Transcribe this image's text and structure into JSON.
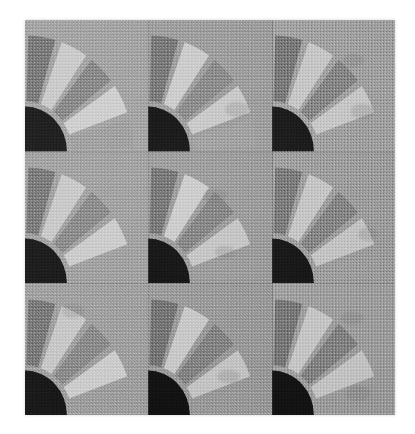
{
  "image": {
    "subject": "quilt-fan-blocks",
    "description": "Grayscale photograph of a patchwork quilt made of nine fan blocks arranged in a three by three grid",
    "page_background": "#ffffff",
    "frame": {
      "left": 25,
      "top": 20,
      "width": 370,
      "height": 395
    }
  },
  "palette": {
    "page": "#ffffff",
    "block_background_light": "#a3a3a3",
    "block_background_mid": "#979797",
    "block_background_dark": "#8d8d8d",
    "blade_dark": "#767676",
    "blade_mid_dark": "#858585",
    "blade_light": "#c2c2c2",
    "blade_lightest": "#cfcfcf",
    "center_quarter_circle": "#161616",
    "seam": "#5e5e5e"
  },
  "grid": {
    "rows": 3,
    "columns": 3,
    "block_count": 9
  },
  "fan_geometry": {
    "blade_count": 5,
    "sweep_degrees": 90,
    "center_corner": "bottom-left",
    "center_radius_ratio": 0.34,
    "blade_inner_radius_ratio": 0.38,
    "blade_outer_radius_ratio": 0.88,
    "gap_degrees": 3.5
  },
  "blocks": [
    {
      "id": "block-r1c1",
      "row": 1,
      "col": 1,
      "background": "#a1a1a1",
      "center": "#141414",
      "blades": [
        "#757575",
        "#c8c8c8",
        "#858585",
        "#cdcdcd",
        "#9d9d9d"
      ],
      "patches": []
    },
    {
      "id": "block-r1c2",
      "row": 1,
      "col": 2,
      "background": "#9d9d9d",
      "center": "#121212",
      "blades": [
        "#777777",
        "#cbcbcb",
        "#8a8a8a",
        "#c9c9c9",
        "#a0a0a0"
      ],
      "patches": [
        {
          "x": 62,
          "y": 62,
          "w": 20,
          "h": 12
        }
      ]
    },
    {
      "id": "block-r1c3",
      "row": 1,
      "col": 3,
      "background": "#a4a4a4",
      "center": "#151515",
      "blades": [
        "#787878",
        "#cacaca",
        "#878787",
        "#cbcbcb",
        "#a2a2a2"
      ],
      "patches": [
        {
          "x": 58,
          "y": 26,
          "w": 17,
          "h": 10
        },
        {
          "x": 64,
          "y": 64,
          "w": 19,
          "h": 11
        }
      ]
    },
    {
      "id": "block-r2c1",
      "row": 2,
      "col": 1,
      "background": "#9f9f9f",
      "center": "#131313",
      "blades": [
        "#767676",
        "#c7c7c7",
        "#888888",
        "#cacaca",
        "#9e9e9e"
      ],
      "patches": []
    },
    {
      "id": "block-r2c2",
      "row": 2,
      "col": 2,
      "background": "#9b9b9b",
      "center": "#101010",
      "blades": [
        "#747474",
        "#cccccc",
        "#848484",
        "#c6c6c6",
        "#9c9c9c"
      ],
      "patches": [
        {
          "x": 44,
          "y": 28,
          "w": 20,
          "h": 11
        },
        {
          "x": 54,
          "y": 72,
          "w": 16,
          "h": 9
        }
      ]
    },
    {
      "id": "block-r2c3",
      "row": 2,
      "col": 3,
      "background": "#a0a0a0",
      "center": "#121212",
      "blades": [
        "#7a7a7a",
        "#c9c9c9",
        "#868686",
        "#c8c8c8",
        "#a1a1a1"
      ],
      "patches": [
        {
          "x": 70,
          "y": 58,
          "w": 16,
          "h": 10
        }
      ]
    },
    {
      "id": "block-r3c1",
      "row": 3,
      "col": 1,
      "background": "#9e9e9e",
      "center": "#141414",
      "blades": [
        "#767676",
        "#c6c6c6",
        "#898989",
        "#cbcbcb",
        "#9d9d9d"
      ],
      "patches": [
        {
          "x": 30,
          "y": 16,
          "w": 18,
          "h": 10
        }
      ]
    },
    {
      "id": "block-r3c2",
      "row": 3,
      "col": 2,
      "background": "#9a9a9a",
      "center": "#111111",
      "blades": [
        "#737373",
        "#c9c9c9",
        "#838383",
        "#c5c5c5",
        "#9b9b9b"
      ],
      "patches": [
        {
          "x": 56,
          "y": 66,
          "w": 18,
          "h": 10
        }
      ]
    },
    {
      "id": "block-r3c3",
      "row": 3,
      "col": 3,
      "background": "#a2a2a2",
      "center": "#131313",
      "blades": [
        "#787878",
        "#cacaca",
        "#858585",
        "#c9c9c9",
        "#a0a0a0"
      ],
      "patches": [
        {
          "x": 56,
          "y": 22,
          "w": 18,
          "h": 10
        },
        {
          "x": 60,
          "y": 78,
          "w": 20,
          "h": 11
        }
      ]
    }
  ]
}
